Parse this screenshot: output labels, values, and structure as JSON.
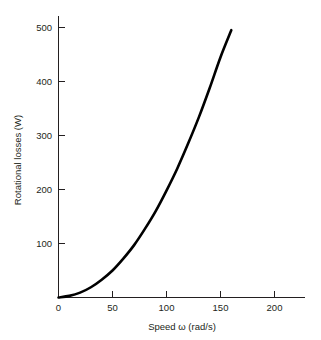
{
  "chart_data": {
    "type": "line",
    "title": "",
    "xlabel": "Speed ω (rad/s)",
    "ylabel": "Rotational losses (W)",
    "xlim": [
      0,
      230
    ],
    "ylim": [
      0,
      520
    ],
    "grid": false,
    "legend": "none",
    "xticks": [
      0,
      50,
      100,
      150,
      200
    ],
    "xticklabels": [
      "0",
      "50",
      "100",
      "150",
      "200"
    ],
    "yticks": [
      100,
      200,
      300,
      400,
      500
    ],
    "yticklabels": [
      "100",
      "200",
      "300",
      "400",
      "500"
    ],
    "series": [
      {
        "name": "Rotational losses",
        "color": "#000000",
        "x": [
          0,
          10,
          20,
          30,
          40,
          50,
          60,
          70,
          80,
          90,
          100,
          110,
          120,
          130,
          140,
          150,
          160
        ],
        "y": [
          0,
          3,
          9,
          19,
          33,
          50,
          72,
          97,
          127,
          160,
          198,
          239,
          285,
          334,
          388,
          445,
          495
        ]
      }
    ]
  },
  "axis": {
    "x_label": "Speed ω (rad/s)",
    "y_label": "Rotational losses (W)",
    "x_tick_0": "0",
    "x_tick_1": "50",
    "x_tick_2": "100",
    "x_tick_3": "150",
    "x_tick_4": "200",
    "y_tick_0": "100",
    "y_tick_1": "200",
    "y_tick_2": "300",
    "y_tick_3": "400",
    "y_tick_4": "500"
  },
  "colors": {
    "curve": "#000000",
    "axis": "#231f20",
    "background": "#ffffff"
  }
}
